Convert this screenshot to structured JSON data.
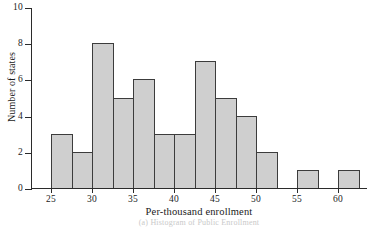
{
  "chart_data": {
    "type": "bar",
    "title": "",
    "subtitle": "",
    "xlabel": "Per-thousand enrollment",
    "ylabel": "Number of states",
    "caption": "(a) Histogram of Public Enrollment",
    "xlim": [
      22.5,
      63.5
    ],
    "ylim": [
      0,
      10
    ],
    "grid": false,
    "legend": null,
    "bin_width": 2.5,
    "x_ticks": [
      25,
      30,
      35,
      40,
      45,
      50,
      55,
      60
    ],
    "x_tick_labels": [
      "25",
      "30",
      "35",
      "40",
      "45",
      "50",
      "55",
      "60"
    ],
    "y_ticks": [
      0,
      2,
      4,
      6,
      8,
      10
    ],
    "y_tick_labels": [
      "0",
      "2",
      "4",
      "6",
      "8",
      "10"
    ],
    "bar_fill": "#cfcfcf",
    "bar_edge": "#3c3c3c",
    "axis_color": "#2b2b2b",
    "bins": [
      {
        "start": 25.0,
        "end": 27.5,
        "count": 3
      },
      {
        "start": 27.5,
        "end": 30.0,
        "count": 2
      },
      {
        "start": 30.0,
        "end": 32.5,
        "count": 8
      },
      {
        "start": 32.5,
        "end": 35.0,
        "count": 5
      },
      {
        "start": 35.0,
        "end": 37.5,
        "count": 6
      },
      {
        "start": 37.5,
        "end": 40.0,
        "count": 3
      },
      {
        "start": 40.0,
        "end": 42.5,
        "count": 3
      },
      {
        "start": 42.5,
        "end": 45.0,
        "count": 7
      },
      {
        "start": 45.0,
        "end": 47.5,
        "count": 5
      },
      {
        "start": 47.5,
        "end": 50.0,
        "count": 4
      },
      {
        "start": 50.0,
        "end": 52.5,
        "count": 2
      },
      {
        "start": 55.0,
        "end": 57.5,
        "count": 1
      },
      {
        "start": 60.0,
        "end": 62.5,
        "count": 1
      }
    ],
    "categories": [
      "25-27.5",
      "27.5-30",
      "30-32.5",
      "32.5-35",
      "35-37.5",
      "37.5-40",
      "40-42.5",
      "42.5-45",
      "45-47.5",
      "47.5-50",
      "50-52.5",
      "55-57.5",
      "60-62.5"
    ],
    "values": [
      3,
      2,
      8,
      5,
      6,
      3,
      3,
      7,
      5,
      4,
      2,
      1,
      1
    ]
  }
}
